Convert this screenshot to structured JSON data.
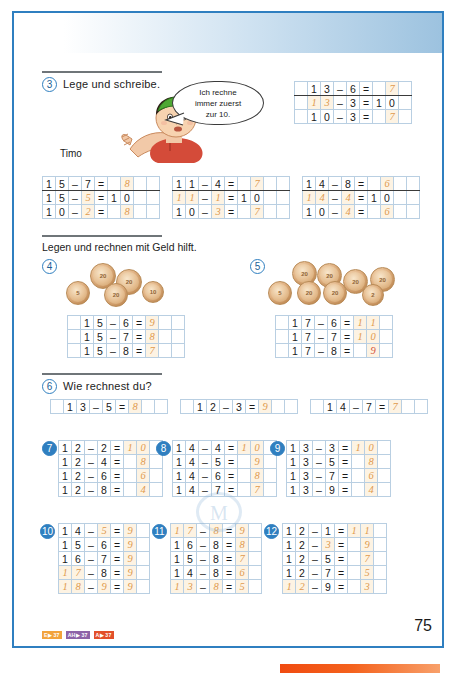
{
  "page": {
    "number": "75",
    "accent_blue": "#2f7fc0",
    "answer_orange": "#e09a4e",
    "answer_red": "#d4553c"
  },
  "character": {
    "name": "Timo",
    "speech": [
      "Ich rechne",
      "immer zuerst",
      "zur 10."
    ]
  },
  "tasks": {
    "t3": {
      "number": "3",
      "title": "Lege und schreibe.",
      "tables": [
        {
          "name": "t3-col1",
          "rows": [
            [
              "1",
              "5",
              "–",
              "7",
              "=",
              "",
              "8"
            ],
            [
              "1",
              "5",
              "–",
              "5",
              "=",
              "1",
              "0"
            ],
            [
              "1",
              "0",
              "–",
              "2",
              "=",
              "",
              "8"
            ]
          ],
          "answer_cells": [
            [
              6
            ],
            [
              3
            ],
            [
              3,
              6
            ]
          ]
        },
        {
          "name": "t3-col2",
          "rows": [
            [
              "1",
              "1",
              "–",
              "4",
              "=",
              "",
              "7"
            ],
            [
              "1",
              "1",
              "–",
              "1",
              "=",
              "1",
              "0"
            ],
            [
              "1",
              "0",
              "–",
              "3",
              "=",
              "",
              "7"
            ]
          ],
          "answer_cells": [
            [
              6
            ],
            [
              0,
              1,
              3
            ],
            [
              3,
              6
            ]
          ]
        },
        {
          "name": "t3-col3",
          "rows": [
            [
              "1",
              "4",
              "–",
              "8",
              "=",
              "",
              "6"
            ],
            [
              "1",
              "4",
              "–",
              "4",
              "=",
              "1",
              "0"
            ],
            [
              "1",
              "0",
              "–",
              "4",
              "=",
              "",
              "6"
            ]
          ],
          "answer_cells": [
            [
              6
            ],
            [
              0,
              1,
              3
            ],
            [
              3,
              6
            ]
          ]
        }
      ],
      "example_table": {
        "name": "t3-example",
        "rows": [
          [
            "1",
            "3",
            "–",
            "6",
            "=",
            "",
            "7"
          ],
          [
            "1",
            "3",
            "–",
            "3",
            "=",
            "1",
            "0"
          ],
          [
            "1",
            "0",
            "–",
            "3",
            "=",
            "",
            "7"
          ]
        ],
        "answer_cells": [
          [
            6
          ],
          [
            0,
            1
          ],
          [
            6
          ]
        ]
      }
    },
    "money_title": "Legen und rechnen mit Geld hilft.",
    "t4": {
      "number": "4",
      "coins": [
        "5",
        "20",
        "20",
        "20",
        "10"
      ],
      "rows": [
        [
          "1",
          "5",
          "–",
          "6",
          "=",
          "9"
        ],
        [
          "1",
          "5",
          "–",
          "7",
          "=",
          "8"
        ],
        [
          "1",
          "5",
          "–",
          "8",
          "=",
          "7"
        ]
      ],
      "answer_cells": [
        [
          5
        ],
        [
          5
        ],
        [
          5
        ]
      ]
    },
    "t5": {
      "number": "5",
      "coins": [
        "5",
        "20",
        "20",
        "20",
        "20",
        "20",
        "20",
        "2"
      ],
      "rows": [
        [
          "1",
          "7",
          "–",
          "6",
          "=",
          "1",
          "1"
        ],
        [
          "1",
          "7",
          "–",
          "7",
          "=",
          "1",
          "0"
        ],
        [
          "1",
          "7",
          "–",
          "8",
          "=",
          "",
          "9"
        ]
      ],
      "answer_cells": [
        [
          5,
          6
        ],
        [
          5,
          6
        ],
        [
          6
        ]
      ],
      "red_cells": [
        [],
        [],
        [
          6
        ]
      ]
    },
    "t6": {
      "number": "6",
      "title": "Wie rechnest du?",
      "items": [
        {
          "name": "t6-a",
          "cells": [
            "1",
            "3",
            "–",
            "5",
            "=",
            "8"
          ],
          "answer_cells": [
            5
          ]
        },
        {
          "name": "t6-b",
          "cells": [
            "1",
            "2",
            "–",
            "3",
            "=",
            "9"
          ],
          "answer_cells": [
            5
          ]
        },
        {
          "name": "t6-c",
          "cells": [
            "1",
            "4",
            "–",
            "7",
            "=",
            "7"
          ],
          "answer_cells": [
            5
          ]
        }
      ]
    },
    "t7": {
      "number": "7",
      "rows": [
        [
          "1",
          "2",
          "–",
          "2",
          "=",
          "1",
          "0"
        ],
        [
          "1",
          "2",
          "–",
          "4",
          "=",
          "",
          "8"
        ],
        [
          "1",
          "2",
          "–",
          "6",
          "=",
          "",
          "6"
        ],
        [
          "1",
          "2",
          "–",
          "8",
          "=",
          "",
          "4"
        ]
      ],
      "answer_cells": [
        [
          5,
          6
        ],
        [
          6
        ],
        [
          6
        ],
        [
          6
        ]
      ]
    },
    "t8": {
      "number": "8",
      "rows": [
        [
          "1",
          "4",
          "–",
          "4",
          "=",
          "1",
          "0"
        ],
        [
          "1",
          "4",
          "–",
          "5",
          "=",
          "",
          "9"
        ],
        [
          "1",
          "4",
          "–",
          "6",
          "=",
          "",
          "8"
        ],
        [
          "1",
          "4",
          "–",
          "7",
          "=",
          "",
          "7"
        ]
      ],
      "answer_cells": [
        [
          5,
          6
        ],
        [
          6
        ],
        [
          6
        ],
        [
          6
        ]
      ]
    },
    "t9": {
      "number": "9",
      "rows": [
        [
          "1",
          "3",
          "–",
          "3",
          "=",
          "1",
          "0"
        ],
        [
          "1",
          "3",
          "–",
          "5",
          "=",
          "",
          "8"
        ],
        [
          "1",
          "3",
          "–",
          "7",
          "=",
          "",
          "6"
        ],
        [
          "1",
          "3",
          "–",
          "9",
          "=",
          "",
          "4"
        ]
      ],
      "answer_cells": [
        [
          5,
          6
        ],
        [
          6
        ],
        [
          6
        ],
        [
          6
        ]
      ]
    },
    "t10": {
      "number": "10",
      "rows": [
        [
          "1",
          "4",
          "–",
          "5",
          "=",
          "9"
        ],
        [
          "1",
          "5",
          "–",
          "6",
          "=",
          "9"
        ],
        [
          "1",
          "6",
          "–",
          "7",
          "=",
          "9"
        ],
        [
          "1",
          "7",
          "–",
          "8",
          "=",
          "9"
        ],
        [
          "1",
          "8",
          "–",
          "9",
          "=",
          "9"
        ]
      ],
      "answer_cells": [
        [
          3,
          5
        ],
        [
          5
        ],
        [
          5
        ],
        [
          0,
          1,
          5
        ],
        [
          0,
          1,
          3,
          5
        ]
      ]
    },
    "t11": {
      "number": "11",
      "rows": [
        [
          "1",
          "7",
          "–",
          "8",
          "=",
          "9"
        ],
        [
          "1",
          "6",
          "–",
          "8",
          "=",
          "8"
        ],
        [
          "1",
          "5",
          "–",
          "8",
          "=",
          "7"
        ],
        [
          "1",
          "4",
          "–",
          "8",
          "=",
          "6"
        ],
        [
          "1",
          "3",
          "–",
          "8",
          "=",
          "5"
        ]
      ],
      "answer_cells": [
        [
          0,
          1,
          3,
          5
        ],
        [
          5
        ],
        [
          5
        ],
        [
          5
        ],
        [
          0,
          1,
          3,
          5
        ]
      ]
    },
    "t12": {
      "number": "12",
      "rows": [
        [
          "1",
          "2",
          "–",
          "1",
          "=",
          "1",
          "1"
        ],
        [
          "1",
          "2",
          "–",
          "3",
          "=",
          "",
          "9"
        ],
        [
          "1",
          "2",
          "–",
          "5",
          "=",
          "",
          "7"
        ],
        [
          "1",
          "2",
          "–",
          "7",
          "=",
          "",
          "5"
        ],
        [
          "1",
          "2",
          "–",
          "9",
          "=",
          "",
          "3"
        ]
      ],
      "answer_cells": [
        [
          5,
          6
        ],
        [
          3,
          6
        ],
        [
          6
        ],
        [
          6
        ],
        [
          0,
          1,
          6
        ]
      ]
    }
  },
  "footer": {
    "badges": [
      {
        "label": "E▶ 37",
        "color": "#f2a33c",
        "style": "b-orange"
      },
      {
        "label": "AH▶ 37",
        "color": "#8d63a8",
        "style": "b-purple"
      },
      {
        "label": "A▶ 37",
        "color": "#e2502a",
        "style": "b-red"
      }
    ]
  }
}
